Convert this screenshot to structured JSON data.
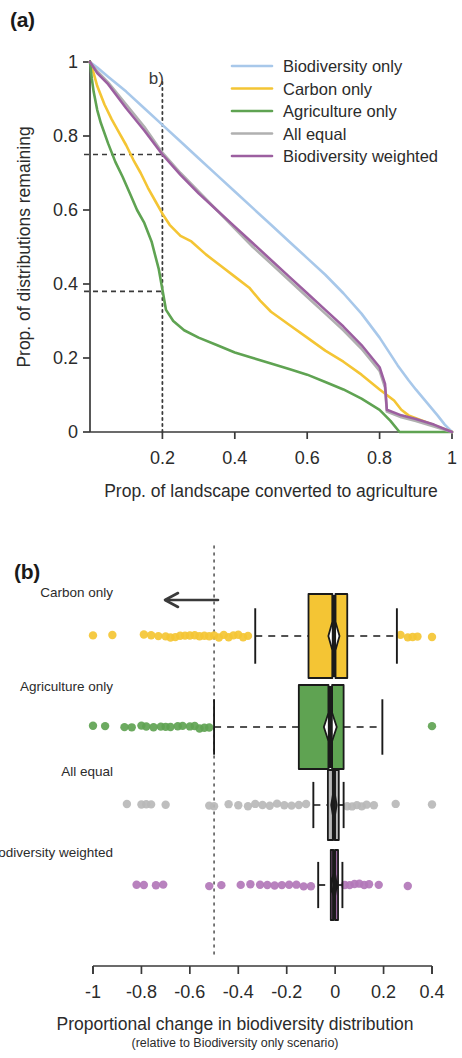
{
  "figure": {
    "panel_a_tag": "(a)",
    "panel_b_tag": "(b)"
  },
  "panel_a": {
    "annotation_label": "b)",
    "xlabel": "Prop. of landscape converted to agriculture",
    "ylabel": "Prop. of distributions remaining",
    "x_ticks": [
      "0.2",
      "0.4",
      "0.6",
      "0.8",
      "1"
    ],
    "y_ticks": [
      "0",
      "0.2",
      "0.4",
      "0.6",
      "0.8",
      "1"
    ],
    "legend": [
      {
        "label": "Biodiversity only",
        "color": "#a8c8ea",
        "style": "solid"
      },
      {
        "label": "Carbon only",
        "color": "#f4c534",
        "style": "solid"
      },
      {
        "label": "Agriculture only",
        "color": "#5fa352",
        "style": "solid"
      },
      {
        "label": "All equal",
        "color": "#b0b0b0",
        "style": "solid"
      },
      {
        "label": "Biodiversity weighted",
        "color": "#9c5fa0",
        "style": "solid"
      }
    ]
  },
  "panel_b": {
    "xlabel": "Proportional change in biodiversity distribution",
    "xsublabel": "(relative to Biodiversity only scenario)",
    "x_ticks": [
      "-1",
      "-0.8",
      "-0.6",
      "-0.4",
      "-0.2",
      "0",
      "0.2",
      "0.4"
    ],
    "reference_line_value": -0.5,
    "arrow_direction": "left",
    "rows": [
      {
        "label": "Carbon only",
        "color": "#f4c534"
      },
      {
        "label": "Agriculture only",
        "color": "#5fa352"
      },
      {
        "label": "All equal",
        "color": "#b8b8b8"
      },
      {
        "label": "Biodiversity weighted",
        "color": "#b277b9"
      }
    ]
  },
  "chart_data": [
    {
      "type": "line",
      "panel": "(a)",
      "title": "",
      "xlabel": "Prop. of landscape converted to agriculture",
      "ylabel": "Prop. of distributions remaining",
      "xlim": [
        0,
        1
      ],
      "ylim": [
        0,
        1
      ],
      "xticks": [
        0,
        0.2,
        0.4,
        0.6,
        0.8,
        1
      ],
      "yticks": [
        0,
        0.2,
        0.4,
        0.6,
        0.8,
        1
      ],
      "grid": false,
      "legend_position": "top-right",
      "annotations": [
        {
          "text": "b)",
          "x": 0.2,
          "y": 0.95,
          "type": "vline-label"
        },
        {
          "type": "vline",
          "x": 0.2,
          "style": "dotted"
        },
        {
          "type": "hline",
          "y": 0.75,
          "x_end": 0.2,
          "style": "dashed"
        },
        {
          "type": "hline",
          "y": 0.38,
          "x_end": 0.2,
          "style": "dashed"
        }
      ],
      "series": [
        {
          "name": "Biodiversity only",
          "color": "#a8c8ea",
          "x": [
            0,
            0.02,
            0.05,
            0.1,
            0.15,
            0.2,
            0.25,
            0.3,
            0.35,
            0.4,
            0.45,
            0.5,
            0.55,
            0.6,
            0.65,
            0.7,
            0.75,
            0.8,
            0.85,
            0.88,
            0.9,
            0.93,
            0.96,
            0.98,
            1
          ],
          "y": [
            1,
            0.985,
            0.96,
            0.92,
            0.875,
            0.83,
            0.785,
            0.74,
            0.695,
            0.65,
            0.605,
            0.56,
            0.515,
            0.47,
            0.425,
            0.375,
            0.32,
            0.255,
            0.18,
            0.14,
            0.115,
            0.08,
            0.045,
            0.02,
            0
          ]
        },
        {
          "name": "Carbon only",
          "color": "#f4c534",
          "x": [
            0,
            0.01,
            0.02,
            0.04,
            0.06,
            0.08,
            0.1,
            0.12,
            0.14,
            0.16,
            0.18,
            0.2,
            0.22,
            0.25,
            0.28,
            0.32,
            0.36,
            0.4,
            0.44,
            0.47,
            0.5,
            0.55,
            0.6,
            0.65,
            0.7,
            0.75,
            0.8,
            0.82,
            0.84,
            0.86,
            0.88,
            0.92,
            0.96,
            1
          ],
          "y": [
            1,
            0.97,
            0.935,
            0.885,
            0.845,
            0.81,
            0.775,
            0.735,
            0.7,
            0.66,
            0.625,
            0.59,
            0.56,
            0.53,
            0.515,
            0.48,
            0.45,
            0.42,
            0.39,
            0.355,
            0.325,
            0.29,
            0.255,
            0.22,
            0.19,
            0.155,
            0.115,
            0.1,
            0.085,
            0.06,
            0.045,
            0.03,
            0.015,
            0
          ]
        },
        {
          "name": "Agriculture only",
          "color": "#5fa352",
          "x": [
            0,
            0.005,
            0.01,
            0.02,
            0.03,
            0.05,
            0.07,
            0.09,
            0.11,
            0.13,
            0.15,
            0.17,
            0.19,
            0.2,
            0.21,
            0.23,
            0.26,
            0.3,
            0.35,
            0.4,
            0.45,
            0.5,
            0.55,
            0.6,
            0.65,
            0.7,
            0.75,
            0.8,
            0.83,
            0.855,
            0.86,
            1
          ],
          "y": [
            1,
            0.955,
            0.92,
            0.87,
            0.835,
            0.78,
            0.73,
            0.69,
            0.645,
            0.6,
            0.565,
            0.515,
            0.44,
            0.385,
            0.33,
            0.3,
            0.275,
            0.255,
            0.235,
            0.215,
            0.2,
            0.185,
            0.17,
            0.155,
            0.135,
            0.115,
            0.09,
            0.06,
            0.03,
            0.0,
            0.0,
            0.0
          ]
        },
        {
          "name": "All equal",
          "color": "#b0b0b0",
          "x": [
            0,
            0.02,
            0.05,
            0.1,
            0.15,
            0.2,
            0.25,
            0.3,
            0.35,
            0.4,
            0.45,
            0.5,
            0.55,
            0.6,
            0.65,
            0.7,
            0.75,
            0.8,
            0.815,
            0.82,
            0.86,
            0.9,
            0.95,
            1
          ],
          "y": [
            1,
            0.975,
            0.945,
            0.885,
            0.825,
            0.755,
            0.7,
            0.65,
            0.6,
            0.55,
            0.5,
            0.455,
            0.41,
            0.365,
            0.32,
            0.275,
            0.225,
            0.165,
            0.12,
            0.055,
            0.04,
            0.03,
            0.015,
            0
          ]
        },
        {
          "name": "Biodiversity weighted",
          "color": "#9c5fa0",
          "x": [
            0,
            0.02,
            0.05,
            0.1,
            0.15,
            0.2,
            0.25,
            0.3,
            0.35,
            0.4,
            0.45,
            0.5,
            0.55,
            0.6,
            0.65,
            0.7,
            0.75,
            0.8,
            0.815,
            0.82,
            0.86,
            0.9,
            0.95,
            1
          ],
          "y": [
            1,
            0.97,
            0.94,
            0.875,
            0.815,
            0.75,
            0.695,
            0.645,
            0.6,
            0.555,
            0.51,
            0.465,
            0.42,
            0.375,
            0.33,
            0.285,
            0.235,
            0.175,
            0.13,
            0.06,
            0.045,
            0.035,
            0.02,
            0
          ]
        }
      ]
    },
    {
      "type": "boxplot",
      "panel": "(b)",
      "title": "",
      "xlabel": "Proportional change in biodiversity distribution",
      "xsublabel": "(relative to Biodiversity only scenario)",
      "xlim": [
        -1.05,
        0.45
      ],
      "xticks": [
        -1,
        -0.8,
        -0.6,
        -0.4,
        -0.2,
        0,
        0.2,
        0.4
      ],
      "grid": false,
      "reference_line": -0.5,
      "orientation": "horizontal",
      "boxes": [
        {
          "name": "Carbon only",
          "color": "#f4c534",
          "whisker_low": -0.33,
          "q1": -0.11,
          "median": -0.005,
          "q3": 0.05,
          "whisker_high": 0.255,
          "notch_low": -0.025,
          "notch_high": 0.01,
          "outliers": [
            -1.0,
            -0.92,
            -0.79,
            -0.76,
            -0.73,
            -0.7,
            -0.68,
            -0.66,
            -0.64,
            -0.62,
            -0.6,
            -0.58,
            -0.56,
            -0.54,
            -0.52,
            -0.5,
            -0.48,
            -0.46,
            -0.44,
            -0.42,
            -0.4,
            -0.38,
            -0.36,
            0.27,
            0.3,
            0.32,
            0.34,
            0.4
          ]
        },
        {
          "name": "Agriculture only",
          "color": "#5fa352",
          "whisker_low": -0.5,
          "q1": -0.15,
          "median": -0.02,
          "q3": 0.035,
          "whisker_high": 0.195,
          "notch_low": -0.04,
          "notch_high": 0.0,
          "outliers": [
            -1.0,
            -0.95,
            -0.87,
            -0.84,
            -0.8,
            -0.78,
            -0.75,
            -0.72,
            -0.7,
            -0.68,
            -0.65,
            -0.63,
            -0.6,
            -0.58,
            -0.56,
            -0.54,
            -0.52,
            0.4
          ]
        },
        {
          "name": "All equal",
          "color": "#b8b8b8",
          "whisker_low": -0.09,
          "q1": -0.03,
          "median": -0.005,
          "q3": 0.015,
          "whisker_high": 0.035,
          "notch_low": -0.012,
          "notch_high": 0.0,
          "outliers": [
            -0.86,
            -0.8,
            -0.78,
            -0.76,
            -0.7,
            -0.52,
            -0.5,
            -0.44,
            -0.4,
            -0.36,
            -0.33,
            -0.3,
            -0.27,
            -0.24,
            -0.21,
            -0.18,
            -0.15,
            -0.12,
            0.05,
            0.07,
            0.09,
            0.11,
            0.13,
            0.16,
            0.25,
            0.4
          ]
        },
        {
          "name": "Biodiversity weighted",
          "color": "#b277b9",
          "whisker_low": -0.07,
          "q1": -0.018,
          "median": -0.004,
          "q3": 0.012,
          "whisker_high": 0.03,
          "notch_low": -0.01,
          "notch_high": 0.002,
          "outliers": [
            -0.82,
            -0.79,
            -0.74,
            -0.71,
            -0.52,
            -0.47,
            -0.39,
            -0.35,
            -0.31,
            -0.28,
            -0.25,
            -0.22,
            -0.19,
            -0.16,
            -0.13,
            -0.1,
            0.04,
            0.06,
            0.08,
            0.1,
            0.12,
            0.14,
            0.18,
            0.3
          ]
        }
      ]
    }
  ]
}
